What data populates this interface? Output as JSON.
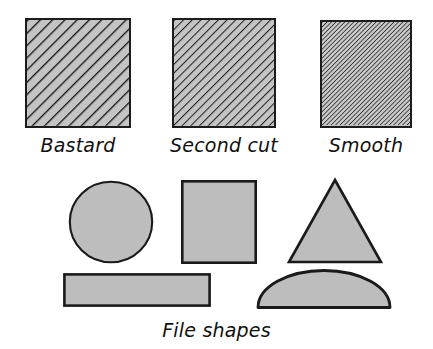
{
  "figure": {
    "title": "File shapes",
    "background_color": "#ffffff",
    "fill_color": "#bdbdbd",
    "outline_color": "#1a1a1a",
    "width": 433,
    "height": 349
  },
  "cut_grades": {
    "heading_visible": false,
    "items": [
      {
        "label": "Bastard",
        "hatch_spacing_px": 9,
        "hatch_stroke_px": 2.6,
        "hatch_angle_deg": 45,
        "description": "coarse widely spaced diagonal hatching"
      },
      {
        "label": "Second cut",
        "hatch_spacing_px": 6.5,
        "hatch_stroke_px": 2.0,
        "hatch_angle_deg": 45,
        "description": "medium diagonal hatching"
      },
      {
        "label": "Smooth",
        "hatch_spacing_px": 3.2,
        "hatch_stroke_px": 1.5,
        "hatch_angle_deg": 45,
        "description": "fine dense diagonal hatching"
      }
    ]
  },
  "file_shapes": {
    "caption": "File shapes",
    "items": [
      {
        "name": "round",
        "shape": "circle"
      },
      {
        "name": "square",
        "shape": "square"
      },
      {
        "name": "triangular",
        "shape": "triangle"
      },
      {
        "name": "flat",
        "shape": "rectangle"
      },
      {
        "name": "half-round",
        "shape": "half-ellipse"
      }
    ]
  }
}
